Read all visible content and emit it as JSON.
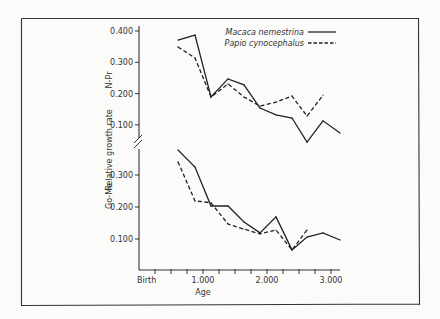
{
  "chart_data": {
    "type": "line",
    "xlabel": "Age",
    "ylabel": "Relative growth rate",
    "x_ticks": [
      {
        "value": 0,
        "label": "Birth"
      },
      {
        "value": 1000,
        "label": "1.000"
      },
      {
        "value": 2000,
        "label": "2.000"
      },
      {
        "value": 3000,
        "label": "3.000"
      }
    ],
    "x_minor_step": 250,
    "xlim": [
      0,
      3150
    ],
    "legend": {
      "placement": "top-right",
      "entries": [
        {
          "name": "Macaca nemestrina",
          "style": "solid"
        },
        {
          "name": "Papio cynocephalus",
          "style": "dashed"
        }
      ]
    },
    "panels": [
      {
        "name": "N-Pr",
        "label": "N-Pr",
        "ylim": [
          0.0,
          0.4
        ],
        "y_ticks": [
          "0.100",
          "0.200",
          "0.300",
          "0.400"
        ],
        "y_tick_values": [
          0.1,
          0.2,
          0.3,
          0.4
        ],
        "series": [
          {
            "name": "Macaca nemestrina",
            "style": "solid",
            "x": [
              609,
              875,
              1125,
              1390,
              1640,
              1890,
              2140,
              2390,
              2625,
              2875,
              3140
            ],
            "y": [
              0.371,
              0.387,
              0.189,
              0.247,
              0.228,
              0.154,
              0.132,
              0.122,
              0.045,
              0.113,
              0.074
            ]
          },
          {
            "name": "Papio cynocephalus",
            "style": "dashed",
            "x": [
              609,
              875,
              1125,
              1390,
              1640,
              1890,
              2140,
              2390,
              2625,
              2875
            ],
            "y": [
              0.349,
              0.314,
              0.189,
              0.231,
              0.189,
              0.16,
              0.173,
              0.192,
              0.128,
              0.195
            ]
          }
        ]
      },
      {
        "name": "Go-Me",
        "label": "Go-Me",
        "ylim": [
          0.0,
          0.4
        ],
        "y_ticks": [
          "0.100",
          "0.200",
          "0.300"
        ],
        "y_tick_values": [
          0.1,
          0.2,
          0.3
        ],
        "series": [
          {
            "name": "Macaca nemestrina",
            "style": "solid",
            "x": [
              609,
              875,
              1125,
              1390,
              1640,
              1890,
              2140,
              2390,
              2625,
              2875,
              3140
            ],
            "y": [
              0.378,
              0.325,
              0.203,
              0.203,
              0.153,
              0.119,
              0.169,
              0.066,
              0.106,
              0.119,
              0.097
            ]
          },
          {
            "name": "Papio cynocephalus",
            "style": "dashed",
            "x": [
              609,
              875,
              1125,
              1390,
              1640,
              1890,
              2140,
              2390,
              2625
            ],
            "y": [
              0.341,
              0.219,
              0.213,
              0.147,
              0.131,
              0.116,
              0.128,
              0.066,
              0.128
            ]
          }
        ]
      }
    ]
  }
}
